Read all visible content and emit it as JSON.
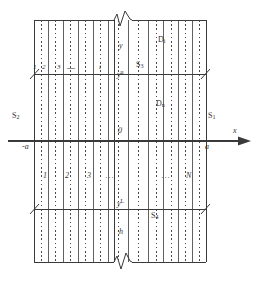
{
  "figure": {
    "type": "technical-schematic",
    "colors": {
      "line": "#3a3a3a",
      "dashed": "#4a4a4a",
      "text": "#333333",
      "background": "#ffffff"
    },
    "axes": {
      "x_axis_label": "x",
      "origin_label": "0",
      "left_bound_label": "-a",
      "right_bound_label": "a",
      "vertical_coordinate_label": "y",
      "upper_interface_label": "y",
      "upper_interface_sup": "u",
      "lower_interface_label": "y",
      "lower_interface_sup": "L",
      "height_label": "h"
    },
    "regions": [
      {
        "id": "S1",
        "letter": "S",
        "sub": "1"
      },
      {
        "id": "S2",
        "letter": "S",
        "sub": "2"
      },
      {
        "id": "S3",
        "letter": "S",
        "sub": "3"
      },
      {
        "id": "S4",
        "letter": "S",
        "sub": "4"
      }
    ],
    "domains": [
      {
        "id": "Di",
        "letter": "D",
        "sub": "i"
      },
      {
        "id": "Dn",
        "letter": "D",
        "sub": "n"
      }
    ],
    "top_strip_indices": [
      "1",
      "2",
      "3",
      "—",
      "i"
    ],
    "bottom_strip_indices": [
      "1",
      "2",
      "3",
      "···",
      "···",
      "N"
    ],
    "ellipsis_top": "—",
    "ellipsis_bottom": "···"
  }
}
